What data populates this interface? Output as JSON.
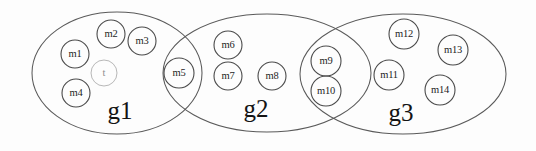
{
  "figure": {
    "kind": "venn-group-diagram",
    "background_color": "#fdfdfd",
    "ellipse_stroke_color": "#5a5a5a",
    "circle_stroke_color": "#4a4a4a",
    "faint_stroke_color": "#b8b8b8",
    "text_color": "#1d1d1d"
  },
  "groups": [
    {
      "id": "g1",
      "label": "g1",
      "label_x": 120,
      "label_y": 113,
      "cx": 117,
      "cy": 73,
      "rx": 85,
      "ry": 61
    },
    {
      "id": "g2",
      "label": "g2",
      "label_x": 256,
      "label_y": 111,
      "cx": 267,
      "cy": 73,
      "rx": 104,
      "ry": 59
    },
    {
      "id": "g3",
      "label": "g3",
      "label_x": 401,
      "label_y": 115,
      "cx": 403,
      "cy": 74,
      "rx": 103,
      "ry": 60
    }
  ],
  "members": [
    {
      "id": "m1",
      "label": "m1",
      "cx": 75,
      "cy": 54,
      "r": 14,
      "faint": false
    },
    {
      "id": "m2",
      "label": "m2",
      "cx": 111,
      "cy": 34,
      "r": 14,
      "faint": false
    },
    {
      "id": "m3",
      "label": "m3",
      "cx": 142,
      "cy": 41,
      "r": 14,
      "faint": false
    },
    {
      "id": "t",
      "label": "t",
      "cx": 104,
      "cy": 73,
      "r": 13,
      "faint": true
    },
    {
      "id": "m4",
      "label": "m4",
      "cx": 76,
      "cy": 93,
      "r": 14,
      "faint": false
    },
    {
      "id": "m5",
      "label": "m5",
      "cx": 179,
      "cy": 73,
      "r": 15,
      "faint": false
    },
    {
      "id": "m6",
      "label": "m6",
      "cx": 228,
      "cy": 45,
      "r": 14,
      "faint": false
    },
    {
      "id": "m7",
      "label": "m7",
      "cx": 228,
      "cy": 76,
      "r": 14,
      "faint": false
    },
    {
      "id": "m8",
      "label": "m8",
      "cx": 272,
      "cy": 76,
      "r": 14,
      "faint": false
    },
    {
      "id": "m9",
      "label": "m9",
      "cx": 326,
      "cy": 61,
      "r": 15,
      "faint": false
    },
    {
      "id": "m10",
      "label": "m10",
      "cx": 326,
      "cy": 91,
      "r": 15,
      "faint": false
    },
    {
      "id": "m11",
      "label": "m11",
      "cx": 389,
      "cy": 75,
      "r": 15,
      "faint": false
    },
    {
      "id": "m12",
      "label": "m12",
      "cx": 404,
      "cy": 34,
      "r": 15,
      "faint": false
    },
    {
      "id": "m13",
      "label": "m13",
      "cx": 453,
      "cy": 50,
      "r": 15,
      "faint": false
    },
    {
      "id": "m14",
      "label": "m14",
      "cx": 440,
      "cy": 90,
      "r": 15,
      "faint": false
    }
  ],
  "memberships": {
    "g1_only": [
      "m1",
      "m2",
      "m3",
      "t",
      "m4"
    ],
    "g1_and_g2": [
      "m5"
    ],
    "g2_only": [
      "m6",
      "m7",
      "m8"
    ],
    "g2_and_g3": [
      "m9",
      "m10"
    ],
    "g3_only": [
      "m11",
      "m12",
      "m13",
      "m14"
    ]
  }
}
